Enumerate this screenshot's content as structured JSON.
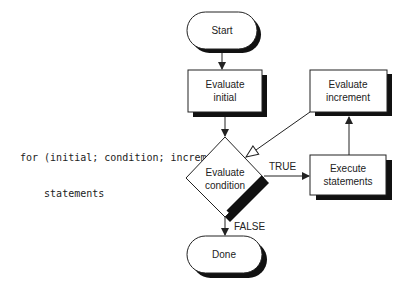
{
  "code": {
    "line1": "for (initial; condition; increment)",
    "line2": "    statements"
  },
  "nodes": {
    "start": {
      "label": "Start",
      "shape": "terminator"
    },
    "init": {
      "line1": "Evaluate",
      "line2": "initial",
      "shape": "process"
    },
    "cond": {
      "line1": "Evaluate",
      "line2": "condition",
      "shape": "decision"
    },
    "exec": {
      "line1": "Execute",
      "line2": "statements",
      "shape": "process"
    },
    "incr": {
      "line1": "Evaluate",
      "line2": "increment",
      "shape": "process"
    },
    "done": {
      "label": "Done",
      "shape": "terminator"
    }
  },
  "edges": {
    "true_label": "TRUE",
    "false_label": "FALSE"
  },
  "colors": {
    "stroke": "#222222",
    "shadow": "#111111",
    "fill": "#ffffff"
  }
}
